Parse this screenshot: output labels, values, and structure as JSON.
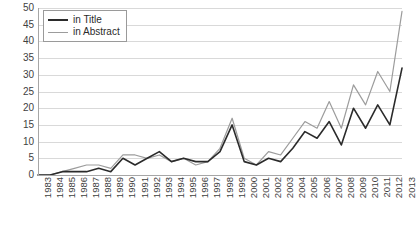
{
  "chart_data": {
    "type": "line",
    "title": "",
    "xlabel": "",
    "ylabel": "",
    "ylim": [
      0,
      50
    ],
    "ytick_step": 5,
    "yticks": [
      50,
      45,
      40,
      35,
      30,
      25,
      20,
      15,
      10,
      5,
      0
    ],
    "grid": true,
    "legend_position": "top-left",
    "categories": [
      "1983",
      "1984",
      "1985",
      "1986",
      "1987",
      "1988",
      "1989",
      "1990",
      "1991",
      "1992",
      "1993",
      "1994",
      "1995",
      "1996",
      "1997",
      "1998",
      "1999",
      "2000",
      "2001",
      "2002",
      "2003",
      "2004",
      "2005",
      "2006",
      "2007",
      "2008",
      "2009",
      "2010",
      "2011",
      "2012",
      "2013"
    ],
    "series": [
      {
        "name": "in Title",
        "color": "#2b2b2b",
        "values": [
          0,
          0,
          1,
          1,
          1,
          2,
          1,
          5,
          3,
          5,
          7,
          4,
          5,
          4,
          4,
          7,
          15,
          4,
          3,
          5,
          4,
          8,
          13,
          11,
          16,
          9,
          20,
          14,
          21,
          15,
          32
        ]
      },
      {
        "name": "in Abstract",
        "color": "#9c9c9c",
        "values": [
          0,
          0,
          1,
          2,
          3,
          3,
          2,
          6,
          6,
          5,
          6,
          4,
          5,
          3,
          4,
          8,
          17,
          5,
          3,
          7,
          6,
          11,
          16,
          14,
          22,
          14,
          27,
          21,
          31,
          25,
          49
        ]
      }
    ]
  },
  "legend": {
    "entries": [
      {
        "label": "in Title",
        "swatch": "line-swatch-dark"
      },
      {
        "label": "in Abstract",
        "swatch": "line-swatch-gray"
      }
    ]
  },
  "colors": {
    "series_title": "#2b2b2b",
    "series_abstract": "#9c9c9c",
    "gridline": "#d9d9d9",
    "axis": "#a6a6a6",
    "tick_text": "#3f3f3f",
    "background": "#ffffff"
  }
}
